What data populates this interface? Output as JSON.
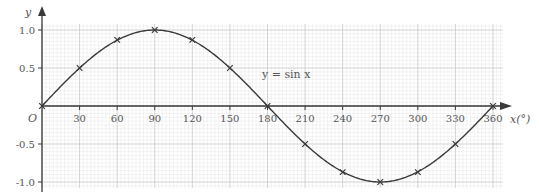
{
  "chart_data": {
    "type": "line",
    "title": "",
    "xlabel": "x(°)",
    "ylabel": "y",
    "origin_label": "O",
    "curve_label": "y = sin x",
    "xlim": [
      0,
      360
    ],
    "ylim": [
      -1.0,
      1.0
    ],
    "grid": true,
    "x_ticks": [
      30,
      60,
      90,
      120,
      150,
      180,
      210,
      240,
      270,
      300,
      330,
      360
    ],
    "x_tick_labels": [
      "30",
      "60",
      "90",
      "120",
      "150",
      "180",
      "210",
      "240",
      "270",
      "300",
      "330",
      "360"
    ],
    "y_ticks": [
      1.0,
      0.5,
      -0.5,
      -1.0
    ],
    "y_tick_labels": [
      "1.0",
      "0.5",
      "-0.5",
      "-1.0"
    ],
    "series": [
      {
        "name": "y = sin x",
        "x": [
          0,
          30,
          60,
          90,
          120,
          150,
          180,
          210,
          240,
          270,
          300,
          330,
          360
        ],
        "values": [
          0,
          0.5,
          0.87,
          1.0,
          0.87,
          0.5,
          0,
          -0.5,
          -0.87,
          -1.0,
          -0.87,
          -0.5,
          0
        ],
        "marker": "x"
      }
    ]
  },
  "colors": {
    "curve": "#3a3a3a",
    "axis": "#3a3a3a",
    "grid_major": "#c8c8c8",
    "grid_minor": "#e6e6e6",
    "text": "#555555"
  }
}
